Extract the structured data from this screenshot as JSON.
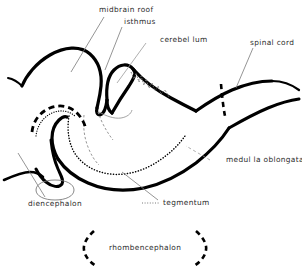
{
  "figure": {
    "title": "rhombencephalon",
    "type": "anatomical-line-diagram",
    "background_color": "#ffffff",
    "ink_color": "#000000",
    "label_color": "#2b2b2b"
  },
  "labels": {
    "midbrain_roof": "midbrain roof",
    "isthmus": "isthmus",
    "cerebellum": "cerebel lum",
    "spinal_cord": "spinal cord",
    "medulla_oblongata": "medul la oblongata",
    "tegmentum": "tegmentum",
    "diencephalon": "diencephalon",
    "rhombencephalon": "rhombencephalon"
  },
  "structures": [
    {
      "name": "midbrain roof",
      "label": "midbrain roof",
      "stroke": "thick-solid",
      "description": "large dorsal arch at upper left curving down to the isthmus"
    },
    {
      "name": "isthmus",
      "label": "isthmus",
      "stroke": "thick-solid",
      "description": "narrow constriction between midbrain roof and cerebellum"
    },
    {
      "name": "cerebellum",
      "label": "cerebel lum",
      "stroke": "thick-solid",
      "description": "wedge-shaped lobe with jagged dotted internal foliation"
    },
    {
      "name": "spinal cord",
      "label": "spinal cord",
      "stroke": "thick-solid",
      "description": "paired tapering lines extending to the right edge"
    },
    {
      "name": "medulla oblongata",
      "label": "medul la oblongata",
      "stroke": "thick-solid",
      "description": "long dorsal roof between cerebellum and spinal cord boundary"
    },
    {
      "name": "tegmentum",
      "label": "tegmentum",
      "stroke": "thick-solid-with-dotted-inner-arc",
      "description": "ventral floor of the brainstem with interior dotted arc"
    },
    {
      "name": "diencephalon",
      "label": "diencephalon",
      "stroke": "thick-dashed",
      "description": "dashed arch at lower left with hook and thin oval beneath"
    },
    {
      "name": "rhombencephalon",
      "label": "rhombencephalon",
      "stroke": "dashed-brackets",
      "description": "extent marker drawn as two large dashed curved braces"
    }
  ],
  "boundary_markers": [
    {
      "name": "medulla-spinal-cord-boundary",
      "style": "vertical thick dashed line"
    }
  ]
}
